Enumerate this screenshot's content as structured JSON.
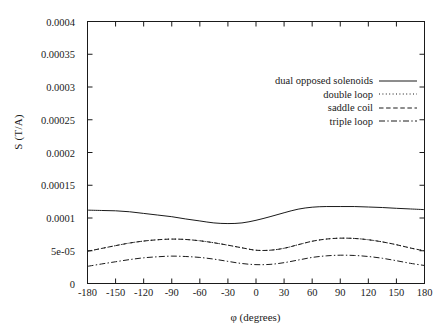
{
  "chart_data": {
    "type": "line",
    "title": "",
    "xlabel": "φ (degrees)",
    "ylabel": "S (T/A)",
    "xlim": [
      -180,
      180
    ],
    "ylim": [
      0,
      0.0004
    ],
    "grid": false,
    "legend_position": "upper-right-inside",
    "xticks": [
      -180,
      -150,
      -120,
      -90,
      -60,
      -30,
      0,
      30,
      60,
      90,
      120,
      150,
      180
    ],
    "xticklabels": [
      "-180",
      "-150",
      "-120",
      "-90",
      "-60",
      "-30",
      "0",
      "30",
      "60",
      "90",
      "120",
      "150",
      "180"
    ],
    "yticks": [
      0,
      5e-05,
      0.0001,
      0.00015,
      0.0002,
      0.00025,
      0.0003,
      0.00035,
      0.0004
    ],
    "yticklabels": [
      "0",
      "5e-05",
      "0.0001",
      "0.00015",
      "0.0002",
      "0.00025",
      "0.0003",
      "0.00035",
      "0.0004"
    ],
    "x": [
      -180,
      -165,
      -150,
      -135,
      -120,
      -105,
      -90,
      -75,
      -60,
      -45,
      -30,
      -15,
      0,
      15,
      30,
      45,
      60,
      75,
      90,
      105,
      120,
      135,
      150,
      165,
      180
    ],
    "series": [
      {
        "name": "dual opposed solenoids",
        "style": "solid",
        "color": "#1a1a1a",
        "values": [
          0.000112,
          0.0001115,
          0.000111,
          0.0001095,
          0.000107,
          0.0001045,
          0.000102,
          9.85e-05,
          9.55e-05,
          9.25e-05,
          9.15e-05,
          9.25e-05,
          9.65e-05,
          0.000102,
          0.000108,
          0.0001135,
          0.0001165,
          0.0001175,
          0.0001175,
          0.0001175,
          0.0001168,
          0.000116,
          0.0001148,
          0.0001138,
          0.0001128
        ]
      },
      {
        "name": "double loop",
        "style": "dotted",
        "color": "#1a1a1a",
        "values": [
          4.92e-05,
          5.35e-05,
          5.78e-05,
          6.18e-05,
          6.48e-05,
          6.68e-05,
          6.78e-05,
          6.72e-05,
          6.52e-05,
          6.22e-05,
          5.85e-05,
          5.45e-05,
          5.08e-05,
          5.08e-05,
          5.38e-05,
          5.92e-05,
          6.45e-05,
          6.78e-05,
          6.92e-05,
          6.88e-05,
          6.68e-05,
          6.35e-05,
          5.92e-05,
          5.42e-05,
          4.98e-05
        ]
      },
      {
        "name": "saddle coil",
        "style": "dashed",
        "color": "#1a1a1a",
        "values": [
          4.92e-05,
          5.35e-05,
          5.78e-05,
          6.18e-05,
          6.48e-05,
          6.68e-05,
          6.78e-05,
          6.72e-05,
          6.52e-05,
          6.22e-05,
          5.85e-05,
          5.45e-05,
          5.08e-05,
          5.08e-05,
          5.38e-05,
          5.92e-05,
          6.45e-05,
          6.78e-05,
          6.92e-05,
          6.88e-05,
          6.68e-05,
          6.35e-05,
          5.92e-05,
          5.42e-05,
          4.98e-05
        ]
      },
      {
        "name": "triple loop",
        "style": "dashdot",
        "color": "#1a1a1a",
        "values": [
          2.62e-05,
          2.98e-05,
          3.32e-05,
          3.65e-05,
          3.92e-05,
          4.08e-05,
          4.18e-05,
          4.12e-05,
          3.98e-05,
          3.72e-05,
          3.38e-05,
          3.05e-05,
          2.88e-05,
          2.92e-05,
          3.18e-05,
          3.58e-05,
          3.98e-05,
          4.22e-05,
          4.32e-05,
          4.28e-05,
          4.12e-05,
          3.85e-05,
          3.48e-05,
          3.08e-05,
          2.75e-05
        ]
      }
    ]
  },
  "legend": {
    "items": [
      {
        "label": "dual opposed solenoids",
        "style": "solid"
      },
      {
        "label": "double loop",
        "style": "dotted"
      },
      {
        "label": "saddle coil",
        "style": "dashed"
      },
      {
        "label": "triple loop",
        "style": "dashdot"
      }
    ]
  }
}
